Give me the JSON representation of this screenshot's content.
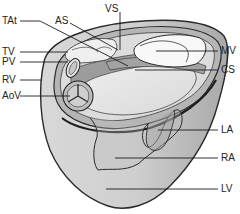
{
  "diagram": {
    "labels": {
      "TAt": "TAt",
      "AS": "AS",
      "VS": "VS",
      "TV": "TV",
      "PV": "PV",
      "RV": "RV",
      "AoV": "AoV",
      "MV": "MV",
      "CS": "CS",
      "LA": "LA",
      "RA": "RA",
      "LV": "LV"
    },
    "colors": {
      "outline": "#2a2a2a",
      "outer_wall": "#c9c9c9",
      "top_surface": "#dcdcdc",
      "ring": "#a8a8a8",
      "inner_floor": "#e6e6e6",
      "mitral_fill": "#f8f8f8",
      "shadow": "#9a9a9a"
    }
  }
}
